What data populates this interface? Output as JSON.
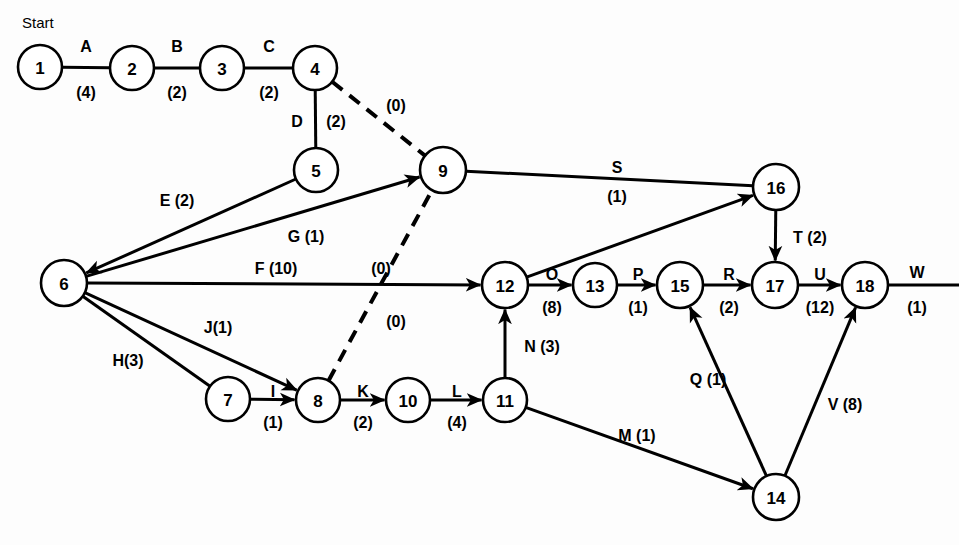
{
  "diagram": {
    "title_label": "Start",
    "colors": {
      "line": "#000000",
      "node_fill": "#ffffff",
      "background": "#fdfdfd"
    },
    "nodes": [
      {
        "id": "1",
        "label": "1",
        "cx": 40,
        "cy": 67,
        "r": 22
      },
      {
        "id": "2",
        "label": "2",
        "cx": 132,
        "cy": 68,
        "r": 22
      },
      {
        "id": "3",
        "label": "3",
        "cx": 222,
        "cy": 68,
        "r": 22
      },
      {
        "id": "4",
        "label": "4",
        "cx": 315,
        "cy": 68,
        "r": 22
      },
      {
        "id": "5",
        "label": "5",
        "cx": 316,
        "cy": 170,
        "r": 22
      },
      {
        "id": "6",
        "label": "6",
        "cx": 64,
        "cy": 283,
        "r": 23
      },
      {
        "id": "7",
        "label": "7",
        "cx": 228,
        "cy": 399,
        "r": 22
      },
      {
        "id": "8",
        "label": "8",
        "cx": 318,
        "cy": 400,
        "r": 22
      },
      {
        "id": "9",
        "label": "9",
        "cx": 443,
        "cy": 170,
        "r": 23
      },
      {
        "id": "10",
        "label": "10",
        "cx": 408,
        "cy": 400,
        "r": 22
      },
      {
        "id": "11",
        "label": "11",
        "cx": 505,
        "cy": 400,
        "r": 22
      },
      {
        "id": "12",
        "label": "12",
        "cx": 505,
        "cy": 285,
        "r": 23
      },
      {
        "id": "13",
        "label": "13",
        "cx": 595,
        "cy": 285,
        "r": 22
      },
      {
        "id": "14",
        "label": "14",
        "cx": 776,
        "cy": 497,
        "r": 23
      },
      {
        "id": "15",
        "label": "15",
        "cx": 680,
        "cy": 285,
        "r": 23
      },
      {
        "id": "16",
        "label": "16",
        "cx": 776,
        "cy": 187,
        "r": 23
      },
      {
        "id": "17",
        "label": "17",
        "cx": 775,
        "cy": 285,
        "r": 23
      },
      {
        "id": "18",
        "label": "18",
        "cx": 865,
        "cy": 285,
        "r": 23
      }
    ],
    "edges": [
      {
        "id": "A",
        "from": "1",
        "to": "2",
        "activity": "A",
        "duration": "(4)",
        "style": "solid",
        "arrow": false
      },
      {
        "id": "B",
        "from": "2",
        "to": "3",
        "activity": "B",
        "duration": "(2)",
        "style": "solid",
        "arrow": false
      },
      {
        "id": "C",
        "from": "3",
        "to": "4",
        "activity": "C",
        "duration": "(2)",
        "style": "solid",
        "arrow": false
      },
      {
        "id": "D",
        "from": "4",
        "to": "5",
        "activity": "D",
        "duration": "(2)",
        "style": "solid",
        "arrow": false
      },
      {
        "id": "dummy-4-9",
        "from": "4",
        "to": "9",
        "activity": "",
        "duration": "(0)",
        "style": "dashed",
        "arrow": false
      },
      {
        "id": "E",
        "from": "5",
        "to": "6",
        "activity": "E",
        "duration": "(2)",
        "style": "solid",
        "arrow": true
      },
      {
        "id": "G",
        "from": "6",
        "to": "9",
        "activity": "G",
        "duration": "(1)",
        "style": "solid",
        "arrow": true
      },
      {
        "id": "F",
        "from": "6",
        "to": "12",
        "activity": "F",
        "duration": "(10)",
        "style": "solid",
        "arrow": true
      },
      {
        "id": "H",
        "from": "6",
        "to": "7",
        "activity": "H",
        "duration": "(3)",
        "style": "solid",
        "arrow": false
      },
      {
        "id": "J",
        "from": "6",
        "to": "8",
        "activity": "J",
        "duration": "(1)",
        "style": "solid",
        "arrow": true
      },
      {
        "id": "I",
        "from": "7",
        "to": "8",
        "activity": "I",
        "duration": "(1)",
        "style": "solid",
        "arrow": true
      },
      {
        "id": "dummy-8-9",
        "from": "8",
        "to": "9",
        "activity": "",
        "duration": "(0)",
        "style": "dashed",
        "arrow": false
      },
      {
        "id": "K",
        "from": "8",
        "to": "10",
        "activity": "K",
        "duration": "(2)",
        "style": "solid",
        "arrow": true
      },
      {
        "id": "L",
        "from": "10",
        "to": "11",
        "activity": "L",
        "duration": "(4)",
        "style": "solid",
        "arrow": true
      },
      {
        "id": "N",
        "from": "11",
        "to": "12",
        "activity": "N",
        "duration": "(3)",
        "style": "solid",
        "arrow": true
      },
      {
        "id": "M",
        "from": "11",
        "to": "14",
        "activity": "M",
        "duration": "(1)",
        "style": "solid",
        "arrow": true
      },
      {
        "id": "S",
        "from": "9",
        "to": "16",
        "activity": "S",
        "duration": "(1)",
        "style": "solid",
        "arrow": false
      },
      {
        "id": "unlabeled-12-16",
        "from": "12",
        "to": "16",
        "activity": "",
        "duration": "",
        "style": "solid",
        "arrow": true
      },
      {
        "id": "O",
        "from": "12",
        "to": "13",
        "activity": "O",
        "duration": "(8)",
        "style": "solid",
        "arrow": true
      },
      {
        "id": "P",
        "from": "13",
        "to": "15",
        "activity": "P",
        "duration": "(1)",
        "style": "solid",
        "arrow": true
      },
      {
        "id": "R",
        "from": "15",
        "to": "17",
        "activity": "R",
        "duration": "(2)",
        "style": "solid",
        "arrow": true
      },
      {
        "id": "T",
        "from": "16",
        "to": "17",
        "activity": "T",
        "duration": "(2)",
        "style": "solid",
        "arrow": true
      },
      {
        "id": "U",
        "from": "17",
        "to": "18",
        "activity": "U",
        "duration": "(12)",
        "style": "solid",
        "arrow": true
      },
      {
        "id": "Q",
        "from": "14",
        "to": "15",
        "activity": "Q",
        "duration": "(1)",
        "style": "solid",
        "arrow": true
      },
      {
        "id": "V",
        "from": "14",
        "to": "18",
        "activity": "V",
        "duration": "(8)",
        "style": "solid",
        "arrow": true
      },
      {
        "id": "W",
        "from": "18",
        "to": "end",
        "activity": "W",
        "duration": "(1)",
        "style": "solid",
        "arrow": false
      }
    ],
    "labels": [
      {
        "id": "lbl-start",
        "text": "Start",
        "x": 22,
        "y": 22,
        "kind": "start"
      },
      {
        "id": "lbl-A",
        "text": "A",
        "x": 86,
        "y": 46,
        "kind": "activity"
      },
      {
        "id": "lbl-A-dur",
        "text": "(4)",
        "x": 86,
        "y": 92,
        "kind": "duration"
      },
      {
        "id": "lbl-B",
        "text": "B",
        "x": 177,
        "y": 46,
        "kind": "activity"
      },
      {
        "id": "lbl-B-dur",
        "text": "(2)",
        "x": 177,
        "y": 92,
        "kind": "duration"
      },
      {
        "id": "lbl-C",
        "text": "C",
        "x": 269,
        "y": 46,
        "kind": "activity"
      },
      {
        "id": "lbl-C-dur",
        "text": "(2)",
        "x": 269,
        "y": 92,
        "kind": "duration"
      },
      {
        "id": "lbl-D",
        "text": "D",
        "x": 297,
        "y": 121,
        "kind": "activity"
      },
      {
        "id": "lbl-D-dur",
        "text": "(2)",
        "x": 336,
        "y": 121,
        "kind": "duration"
      },
      {
        "id": "lbl-d49",
        "text": "(0)",
        "x": 396,
        "y": 105,
        "kind": "duration"
      },
      {
        "id": "lbl-E",
        "text": "E (2)",
        "x": 177,
        "y": 200,
        "kind": "combined"
      },
      {
        "id": "lbl-G",
        "text": "G (1)",
        "x": 306,
        "y": 236,
        "kind": "combined"
      },
      {
        "id": "lbl-F",
        "text": "F (10)",
        "x": 276,
        "y": 268,
        "kind": "combined"
      },
      {
        "id": "lbl-d89a",
        "text": "(0)",
        "x": 381,
        "y": 268,
        "kind": "duration"
      },
      {
        "id": "lbl-d89b",
        "text": "(0)",
        "x": 396,
        "y": 321,
        "kind": "duration"
      },
      {
        "id": "lbl-J",
        "text": "J(1)",
        "x": 218,
        "y": 327,
        "kind": "combined"
      },
      {
        "id": "lbl-H",
        "text": "H(3)",
        "x": 128,
        "y": 360,
        "kind": "combined"
      },
      {
        "id": "lbl-I",
        "text": "I",
        "x": 273,
        "y": 391,
        "kind": "activity"
      },
      {
        "id": "lbl-I-dur",
        "text": "(1)",
        "x": 273,
        "y": 422,
        "kind": "duration"
      },
      {
        "id": "lbl-K",
        "text": "K",
        "x": 363,
        "y": 391,
        "kind": "activity"
      },
      {
        "id": "lbl-K-dur",
        "text": "(2)",
        "x": 363,
        "y": 422,
        "kind": "duration"
      },
      {
        "id": "lbl-L",
        "text": "L",
        "x": 457,
        "y": 391,
        "kind": "activity"
      },
      {
        "id": "lbl-L-dur",
        "text": "(4)",
        "x": 457,
        "y": 422,
        "kind": "duration"
      },
      {
        "id": "lbl-N",
        "text": "N (3)",
        "x": 542,
        "y": 346,
        "kind": "combined"
      },
      {
        "id": "lbl-M",
        "text": "M (1)",
        "x": 637,
        "y": 435,
        "kind": "combined"
      },
      {
        "id": "lbl-S",
        "text": "S",
        "x": 617,
        "y": 167,
        "kind": "activity"
      },
      {
        "id": "lbl-S-dur",
        "text": "(1)",
        "x": 617,
        "y": 196,
        "kind": "duration"
      },
      {
        "id": "lbl-O",
        "text": "O",
        "x": 552,
        "y": 274,
        "kind": "activity"
      },
      {
        "id": "lbl-O-dur",
        "text": "(8)",
        "x": 552,
        "y": 307,
        "kind": "duration"
      },
      {
        "id": "lbl-P",
        "text": "P",
        "x": 638,
        "y": 274,
        "kind": "activity"
      },
      {
        "id": "lbl-P-dur",
        "text": "(1)",
        "x": 638,
        "y": 307,
        "kind": "duration"
      },
      {
        "id": "lbl-R",
        "text": "R",
        "x": 729,
        "y": 274,
        "kind": "activity"
      },
      {
        "id": "lbl-R-dur",
        "text": "(2)",
        "x": 729,
        "y": 307,
        "kind": "duration"
      },
      {
        "id": "lbl-T",
        "text": "T (2)",
        "x": 810,
        "y": 237,
        "kind": "combined"
      },
      {
        "id": "lbl-U",
        "text": "U",
        "x": 820,
        "y": 274,
        "kind": "activity"
      },
      {
        "id": "lbl-U-dur",
        "text": "(12)",
        "x": 820,
        "y": 307,
        "kind": "duration"
      },
      {
        "id": "lbl-W",
        "text": "W",
        "x": 917,
        "y": 272,
        "kind": "activity"
      },
      {
        "id": "lbl-W-dur",
        "text": "(1)",
        "x": 917,
        "y": 307,
        "kind": "duration"
      },
      {
        "id": "lbl-Q",
        "text": "Q (1)",
        "x": 708,
        "y": 379,
        "kind": "combined"
      },
      {
        "id": "lbl-V",
        "text": "V (8)",
        "x": 845,
        "y": 404,
        "kind": "combined"
      }
    ]
  }
}
